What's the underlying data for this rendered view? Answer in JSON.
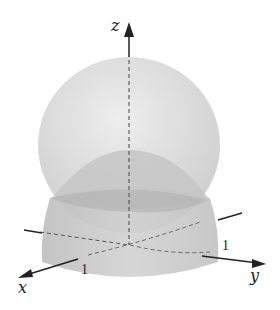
{
  "figure": {
    "axes": {
      "z_label": "z",
      "x_label": "x",
      "y_label": "y",
      "x_tick": "1",
      "y_tick": "1"
    },
    "colors": {
      "sphere": "#d8d8d8",
      "cylinder": "#c4c4c4",
      "cap": "#b8b8b8",
      "axis": "#222222"
    }
  }
}
